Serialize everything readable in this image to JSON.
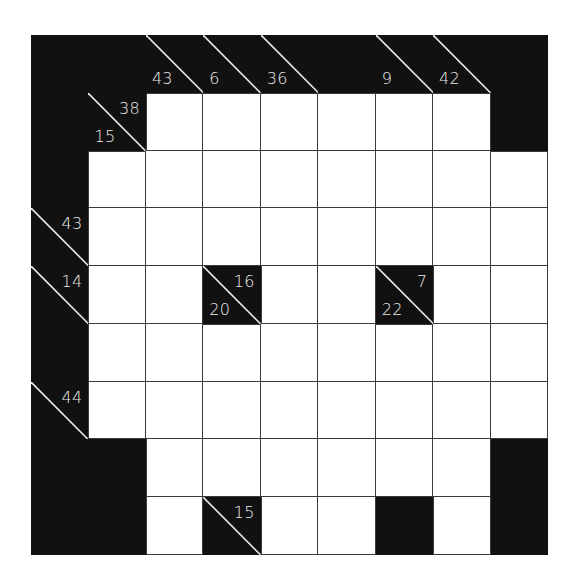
{
  "puzzle": {
    "type": "kakuro",
    "rows": 9,
    "cols": 9,
    "colors": {
      "block": "#111111",
      "empty": "#ffffff",
      "grid_line": "#3a3a3a",
      "clue_text": "#ececec"
    },
    "grid": [
      [
        {
          "t": "B"
        },
        {
          "t": "B"
        },
        {
          "t": "C",
          "down": "43"
        },
        {
          "t": "C",
          "down": "6"
        },
        {
          "t": "C",
          "down": "36"
        },
        {
          "t": "B"
        },
        {
          "t": "C",
          "down": "9"
        },
        {
          "t": "C",
          "down": "42"
        },
        {
          "t": "B"
        }
      ],
      [
        {
          "t": "B"
        },
        {
          "t": "C",
          "across": "38",
          "down": "15"
        },
        {
          "t": "W"
        },
        {
          "t": "W"
        },
        {
          "t": "W"
        },
        {
          "t": "W"
        },
        {
          "t": "W"
        },
        {
          "t": "W"
        },
        {
          "t": "B"
        }
      ],
      [
        {
          "t": "B"
        },
        {
          "t": "W"
        },
        {
          "t": "W"
        },
        {
          "t": "W"
        },
        {
          "t": "W"
        },
        {
          "t": "W"
        },
        {
          "t": "W"
        },
        {
          "t": "W"
        },
        {
          "t": "W"
        }
      ],
      [
        {
          "t": "C",
          "across": "43"
        },
        {
          "t": "W"
        },
        {
          "t": "W"
        },
        {
          "t": "W"
        },
        {
          "t": "W"
        },
        {
          "t": "W"
        },
        {
          "t": "W"
        },
        {
          "t": "W"
        },
        {
          "t": "W"
        }
      ],
      [
        {
          "t": "C",
          "across": "14"
        },
        {
          "t": "W"
        },
        {
          "t": "W"
        },
        {
          "t": "C",
          "across": "16",
          "down": "20"
        },
        {
          "t": "W"
        },
        {
          "t": "W"
        },
        {
          "t": "C",
          "across": "7",
          "down": "22"
        },
        {
          "t": "W"
        },
        {
          "t": "W"
        }
      ],
      [
        {
          "t": "B"
        },
        {
          "t": "W"
        },
        {
          "t": "W"
        },
        {
          "t": "W"
        },
        {
          "t": "W"
        },
        {
          "t": "W"
        },
        {
          "t": "W"
        },
        {
          "t": "W"
        },
        {
          "t": "W"
        }
      ],
      [
        {
          "t": "C",
          "across": "44"
        },
        {
          "t": "W"
        },
        {
          "t": "W"
        },
        {
          "t": "W"
        },
        {
          "t": "W"
        },
        {
          "t": "W"
        },
        {
          "t": "W"
        },
        {
          "t": "W"
        },
        {
          "t": "W"
        }
      ],
      [
        {
          "t": "B"
        },
        {
          "t": "B"
        },
        {
          "t": "W"
        },
        {
          "t": "W"
        },
        {
          "t": "W"
        },
        {
          "t": "W"
        },
        {
          "t": "W"
        },
        {
          "t": "W"
        },
        {
          "t": "B"
        }
      ],
      [
        {
          "t": "B"
        },
        {
          "t": "B"
        },
        {
          "t": "W"
        },
        {
          "t": "C",
          "across": "15"
        },
        {
          "t": "W"
        },
        {
          "t": "W"
        },
        {
          "t": "B"
        },
        {
          "t": "W"
        },
        {
          "t": "B"
        }
      ]
    ]
  }
}
